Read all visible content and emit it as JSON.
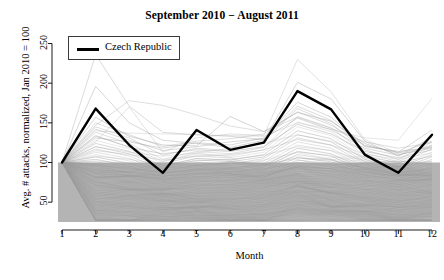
{
  "chart_data": {
    "type": "line",
    "title": "September 2010 − August 2011",
    "xlabel": "Month",
    "ylabel": "Avg. # attacks, normalized, Jan 2010 = 100",
    "x": [
      1,
      2,
      3,
      4,
      5,
      6,
      7,
      8,
      9,
      10,
      11,
      12
    ],
    "xtick_labels": [
      "1",
      "2",
      "3",
      "4",
      "5",
      "6",
      "7",
      "8",
      "9",
      "10",
      "11",
      "12"
    ],
    "ytick_labels": [
      "50",
      "100",
      "150",
      "200",
      "250"
    ],
    "ytick_values": [
      50,
      100,
      150,
      200,
      250
    ],
    "xlim": [
      1,
      12
    ],
    "ylim": [
      25,
      262
    ],
    "grid": false,
    "legend_position": "top-left",
    "legend": [
      {
        "name": "Czech Republic",
        "color": "#000000"
      }
    ],
    "highlight_color": "#000000",
    "background_series_color": "#9a9a9a",
    "shaded_band": {
      "label": "inter-quartile shaded band",
      "color": "#b4b4b4",
      "y_top": 100,
      "y_bottom": 25
    },
    "series": [
      {
        "name": "Czech Republic",
        "highlight": true,
        "values": [
          100,
          168,
          122,
          87,
          141,
          116,
          125,
          190,
          167,
          110,
          87,
          135
        ]
      },
      {
        "name": "country-002",
        "values": [
          100,
          196,
          150,
          128,
          124,
          119,
          128,
          201,
          180,
          127,
          108,
          132
        ]
      },
      {
        "name": "country-003",
        "values": [
          100,
          236,
          171,
          138,
          135,
          133,
          129,
          171,
          153,
          120,
          114,
          119
        ]
      },
      {
        "name": "country-004",
        "values": [
          100,
          147,
          178,
          172,
          160,
          146,
          139,
          157,
          143,
          126,
          118,
          125
        ]
      },
      {
        "name": "country-005",
        "values": [
          100,
          126,
          170,
          113,
          131,
          136,
          134,
          230,
          189,
          129,
          112,
          120
        ]
      },
      {
        "name": "country-006",
        "values": [
          100,
          140,
          137,
          136,
          135,
          134,
          133,
          150,
          142,
          131,
          128,
          181
        ]
      },
      {
        "name": "country-007",
        "values": [
          100,
          157,
          133,
          122,
          121,
          158,
          139,
          163,
          152,
          124,
          110,
          118
        ]
      },
      {
        "name": "country-008",
        "values": [
          100,
          131,
          126,
          118,
          125,
          122,
          131,
          176,
          157,
          121,
          113,
          141
        ]
      },
      {
        "name": "country-009",
        "values": [
          100,
          145,
          131,
          109,
          118,
          115,
          127,
          168,
          149,
          116,
          104,
          126
        ]
      },
      {
        "name": "country-010",
        "values": [
          100,
          138,
          124,
          104,
          114,
          111,
          119,
          158,
          144,
          112,
          101,
          121
        ]
      },
      {
        "name": "country-011",
        "values": [
          100,
          133,
          120,
          101,
          111,
          108,
          116,
          151,
          139,
          109,
          99,
          117
        ]
      },
      {
        "name": "country-012",
        "values": [
          100,
          128,
          117,
          99,
          108,
          106,
          113,
          145,
          134,
          106,
          96,
          113
        ]
      },
      {
        "name": "country-013",
        "values": [
          100,
          124,
          114,
          96,
          105,
          103,
          110,
          140,
          130,
          104,
          94,
          110
        ]
      },
      {
        "name": "country-014",
        "values": [
          100,
          120,
          111,
          94,
          103,
          101,
          107,
          135,
          126,
          101,
          92,
          107
        ]
      },
      {
        "name": "country-015",
        "values": [
          100,
          117,
          108,
          92,
          100,
          98,
          105,
          131,
          122,
          99,
          90,
          104
        ]
      },
      {
        "name": "country-016",
        "values": [
          100,
          113,
          105,
          89,
          97,
          96,
          102,
          126,
          118,
          97,
          88,
          101
        ]
      },
      {
        "name": "country-017",
        "values": [
          100,
          110,
          102,
          87,
          95,
          93,
          99,
          122,
          115,
          94,
          86,
          98
        ]
      },
      {
        "name": "country-018",
        "values": [
          100,
          107,
          99,
          85,
          92,
          91,
          96,
          118,
          111,
          92,
          84,
          95
        ]
      },
      {
        "name": "country-019",
        "values": [
          100,
          104,
          96,
          82,
          90,
          88,
          94,
          114,
          108,
          90,
          82,
          93
        ]
      },
      {
        "name": "country-020",
        "values": [
          100,
          101,
          94,
          80,
          87,
          86,
          91,
          110,
          104,
          88,
          80,
          90
        ]
      },
      {
        "name": "country-021",
        "values": [
          100,
          98,
          91,
          78,
          85,
          84,
          89,
          106,
          101,
          85,
          78,
          87
        ]
      },
      {
        "name": "country-022",
        "values": [
          100,
          95,
          88,
          76,
          82,
          81,
          86,
          103,
          98,
          83,
          76,
          85
        ]
      },
      {
        "name": "country-023",
        "values": [
          100,
          93,
          86,
          74,
          80,
          79,
          84,
          99,
          95,
          81,
          74,
          82
        ]
      },
      {
        "name": "country-024",
        "values": [
          100,
          90,
          83,
          72,
          78,
          77,
          81,
          96,
          92,
          79,
          72,
          80
        ]
      },
      {
        "name": "country-025",
        "values": [
          100,
          87,
          81,
          70,
          76,
          75,
          79,
          92,
          89,
          77,
          70,
          77
        ]
      },
      {
        "name": "country-026",
        "values": [
          100,
          85,
          78,
          68,
          73,
          72,
          77,
          89,
          86,
          75,
          68,
          75
        ]
      },
      {
        "name": "country-027",
        "values": [
          100,
          82,
          76,
          66,
          71,
          70,
          74,
          86,
          83,
          73,
          66,
          73
        ]
      },
      {
        "name": "country-028",
        "values": [
          100,
          80,
          74,
          64,
          69,
          68,
          72,
          83,
          81,
          71,
          65,
          71
        ]
      },
      {
        "name": "country-029",
        "values": [
          100,
          77,
          72,
          62,
          67,
          66,
          70,
          80,
          78,
          69,
          63,
          69
        ]
      },
      {
        "name": "country-030",
        "values": [
          100,
          75,
          69,
          60,
          65,
          64,
          68,
          77,
          75,
          67,
          61,
          66
        ]
      },
      {
        "name": "country-031",
        "values": [
          100,
          72,
          67,
          58,
          63,
          62,
          66,
          74,
          73,
          65,
          59,
          64
        ]
      },
      {
        "name": "country-032",
        "values": [
          100,
          70,
          65,
          57,
          61,
          60,
          64,
          72,
          70,
          63,
          57,
          62
        ]
      },
      {
        "name": "country-033",
        "values": [
          100,
          68,
          63,
          55,
          59,
          58,
          62,
          69,
          68,
          61,
          56,
          60
        ]
      },
      {
        "name": "country-034",
        "values": [
          100,
          65,
          61,
          53,
          57,
          56,
          60,
          66,
          65,
          59,
          54,
          58
        ]
      },
      {
        "name": "country-035",
        "values": [
          100,
          63,
          59,
          51,
          55,
          54,
          58,
          64,
          63,
          57,
          52,
          57
        ]
      },
      {
        "name": "country-036",
        "values": [
          100,
          61,
          57,
          50,
          53,
          53,
          56,
          62,
          61,
          55,
          51,
          55
        ]
      },
      {
        "name": "country-037",
        "values": [
          100,
          59,
          55,
          48,
          51,
          51,
          54,
          59,
          58,
          54,
          49,
          53
        ]
      },
      {
        "name": "country-038",
        "values": [
          100,
          57,
          53,
          46,
          50,
          49,
          52,
          57,
          56,
          52,
          47,
          51
        ]
      },
      {
        "name": "country-039",
        "values": [
          100,
          55,
          51,
          45,
          48,
          47,
          50,
          55,
          54,
          50,
          46,
          49
        ]
      },
      {
        "name": "country-040",
        "values": [
          100,
          53,
          49,
          43,
          46,
          46,
          48,
          53,
          52,
          48,
          44,
          48
        ]
      },
      {
        "name": "country-041",
        "values": [
          100,
          51,
          47,
          41,
          44,
          44,
          47,
          51,
          50,
          47,
          43,
          46
        ]
      },
      {
        "name": "country-042",
        "values": [
          100,
          49,
          45,
          40,
          43,
          42,
          45,
          49,
          48,
          45,
          41,
          44
        ]
      },
      {
        "name": "country-043",
        "values": [
          100,
          47,
          44,
          38,
          41,
          41,
          43,
          47,
          46,
          43,
          40,
          43
        ]
      },
      {
        "name": "country-044",
        "values": [
          100,
          45,
          42,
          37,
          39,
          39,
          41,
          45,
          44,
          42,
          38,
          41
        ]
      },
      {
        "name": "country-045",
        "values": [
          100,
          43,
          40,
          35,
          38,
          37,
          40,
          43,
          42,
          40,
          37,
          39
        ]
      },
      {
        "name": "country-046",
        "values": [
          100,
          41,
          38,
          34,
          36,
          36,
          38,
          41,
          41,
          38,
          35,
          38
        ]
      },
      {
        "name": "country-047",
        "values": [
          100,
          40,
          37,
          32,
          34,
          34,
          36,
          40,
          39,
          37,
          34,
          36
        ]
      },
      {
        "name": "country-048",
        "values": [
          100,
          38,
          35,
          31,
          33,
          33,
          35,
          38,
          37,
          35,
          32,
          35
        ]
      },
      {
        "name": "country-049",
        "values": [
          100,
          36,
          33,
          29,
          31,
          31,
          33,
          36,
          36,
          34,
          31,
          33
        ]
      },
      {
        "name": "country-050",
        "values": [
          100,
          34,
          32,
          28,
          30,
          30,
          31,
          34,
          34,
          32,
          30,
          32
        ]
      },
      {
        "name": "country-051",
        "values": [
          100,
          120,
          113,
          108,
          112,
          118,
          124,
          135,
          127,
          110,
          104,
          112
        ]
      },
      {
        "name": "country-052",
        "values": [
          100,
          134,
          119,
          111,
          116,
          114,
          120,
          148,
          136,
          114,
          106,
          116
        ]
      },
      {
        "name": "country-053",
        "values": [
          100,
          142,
          128,
          115,
          120,
          126,
          130,
          156,
          141,
          118,
          109,
          122
        ]
      },
      {
        "name": "country-054",
        "values": [
          100,
          150,
          135,
          120,
          127,
          130,
          136,
          164,
          147,
          122,
          112,
          127
        ]
      },
      {
        "name": "country-055",
        "values": [
          100,
          115,
          110,
          103,
          108,
          110,
          116,
          129,
          122,
          107,
          100,
          108
        ]
      },
      {
        "name": "country-056",
        "values": [
          100,
          108,
          104,
          97,
          102,
          104,
          109,
          120,
          115,
          102,
          95,
          102
        ]
      },
      {
        "name": "country-057",
        "values": [
          100,
          102,
          99,
          92,
          97,
          99,
          103,
          113,
          109,
          98,
          91,
          97
        ]
      },
      {
        "name": "country-058",
        "values": [
          100,
          96,
          93,
          87,
          91,
          93,
          97,
          106,
          103,
          93,
          87,
          92
        ]
      },
      {
        "name": "country-059",
        "values": [
          100,
          91,
          88,
          83,
          86,
          88,
          92,
          100,
          97,
          88,
          83,
          88
        ]
      },
      {
        "name": "country-060",
        "values": [
          100,
          86,
          84,
          79,
          82,
          84,
          87,
          94,
          92,
          84,
          79,
          83
        ]
      }
    ]
  }
}
